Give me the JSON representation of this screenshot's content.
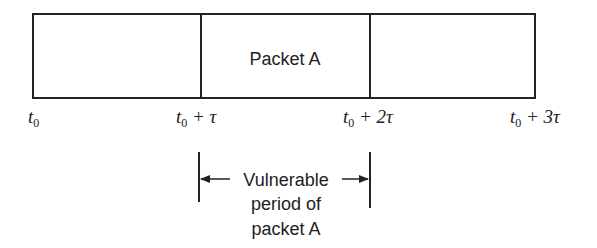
{
  "diagram": {
    "packet_label": "Packet A",
    "time_labels": [
      {
        "base": "t",
        "sub": "0",
        "suffix": ""
      },
      {
        "base": "t",
        "sub": "0",
        "suffix": " + τ"
      },
      {
        "base": "t",
        "sub": "0",
        "suffix": " + 2τ"
      },
      {
        "base": "t",
        "sub": "0",
        "suffix": " + 3τ"
      }
    ],
    "vulnerable_label": {
      "line1": "Vulnerable",
      "line2": "period of",
      "line3": "packet A"
    },
    "colors": {
      "stroke": "#222222",
      "background": "#ffffff"
    }
  }
}
